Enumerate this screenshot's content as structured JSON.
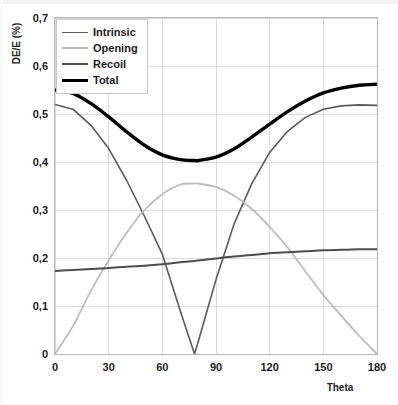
{
  "chart_data": {
    "type": "line",
    "title": "",
    "xlabel": "Theta",
    "ylabel": "DE/E (%)",
    "xlim": [
      0,
      180
    ],
    "ylim": [
      0,
      0.7
    ],
    "xticks": [
      "0",
      "30",
      "60",
      "90",
      "120",
      "150",
      "180"
    ],
    "xtick_values": [
      0,
      30,
      60,
      90,
      120,
      150,
      180
    ],
    "yticks": [
      "0",
      "0,1",
      "0,2",
      "0,3",
      "0,4",
      "0,5",
      "0,6",
      "0,7"
    ],
    "ytick_values": [
      0,
      0.1,
      0.2,
      0.3,
      0.4,
      0.5,
      0.6,
      0.7
    ],
    "decimal_separator": ",",
    "grid": true,
    "legend_position": "top-left-inside",
    "x": [
      0,
      10,
      20,
      30,
      40,
      50,
      60,
      70,
      78,
      80,
      90,
      100,
      110,
      120,
      130,
      140,
      150,
      160,
      170,
      180
    ],
    "series": [
      {
        "name": "Intrinsic",
        "color": "#5a5a5a",
        "width": 1.6,
        "values": [
          0.52,
          0.51,
          0.477,
          0.428,
          0.362,
          0.287,
          0.208,
          0.09,
          0.0,
          0.025,
          0.155,
          0.27,
          0.355,
          0.42,
          0.464,
          0.493,
          0.51,
          0.517,
          0.519,
          0.518
        ]
      },
      {
        "name": "Opening",
        "color": "#bcbcbc",
        "width": 1.8,
        "values": [
          0.0,
          0.058,
          0.131,
          0.195,
          0.252,
          0.3,
          0.333,
          0.353,
          0.355,
          0.355,
          0.348,
          0.33,
          0.302,
          0.265,
          0.222,
          0.172,
          0.123,
          0.08,
          0.038,
          0.0
        ]
      },
      {
        "name": "Recoil",
        "color": "#4d4d4d",
        "width": 2.0,
        "values": [
          0.173,
          0.175,
          0.177,
          0.179,
          0.182,
          0.184,
          0.187,
          0.191,
          0.194,
          0.195,
          0.199,
          0.203,
          0.206,
          0.21,
          0.212,
          0.214,
          0.216,
          0.217,
          0.218,
          0.218
        ]
      },
      {
        "name": "Total",
        "color": "#000000",
        "width": 3.4,
        "values": [
          0.55,
          0.543,
          0.522,
          0.494,
          0.463,
          0.435,
          0.415,
          0.405,
          0.403,
          0.403,
          0.41,
          0.427,
          0.452,
          0.479,
          0.505,
          0.527,
          0.544,
          0.554,
          0.56,
          0.562
        ]
      }
    ],
    "legend": [
      {
        "label": "Intrinsic",
        "color": "#5a5a5a",
        "width": 1.8
      },
      {
        "label": "Opening",
        "color": "#bcbcbc",
        "width": 2.0
      },
      {
        "label": "Recoil",
        "color": "#4d4d4d",
        "width": 2.4
      },
      {
        "label": "Total",
        "color": "#000000",
        "width": 3.6
      }
    ],
    "colors": {
      "grid": "#dcdcdc",
      "frame": "#b4b4b4",
      "text": "#1b1b1b",
      "background": "#ffffff"
    }
  }
}
